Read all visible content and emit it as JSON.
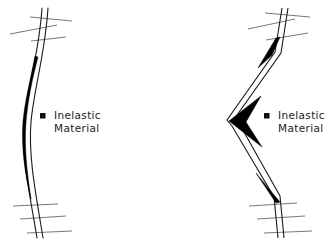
{
  "figure": {
    "background_color": "#ffffff",
    "line_color": "#1b1b1b",
    "fill_color": "#000000",
    "support_line_color": "#555555",
    "panels": [
      {
        "id": "left-panel",
        "name": "distributed-plasticity-column",
        "deformation_type": "smooth flexural S-curve",
        "plastic_zone": "distributed lens-shaped inelastic region at mid-height inner edge",
        "hinge_count": 1,
        "legend": {
          "bullet": "■",
          "bullet_name": "square-bullet",
          "line1": "Inelastic",
          "line2": "Material"
        }
      },
      {
        "id": "right-panel",
        "name": "concentrated-plasticity-column",
        "deformation_type": "sharp V-shaped kink at mid-height",
        "plastic_zone": "concentrated wedge hinges at top, mid-height and bottom",
        "hinge_count": 3,
        "legend": {
          "bullet": "■",
          "bullet_name": "square-bullet",
          "line1": "Inelastic",
          "line2": "Material"
        }
      }
    ],
    "supports": {
      "name": "floor-slab-hatch-lines",
      "lines_per_support": 3,
      "locations": [
        "top",
        "bottom"
      ]
    }
  }
}
